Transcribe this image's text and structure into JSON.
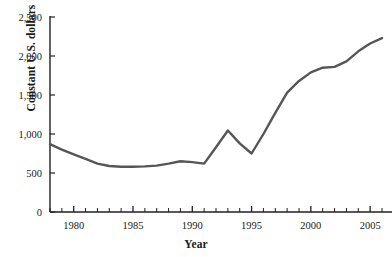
{
  "chart_data": {
    "type": "line",
    "title": "",
    "xlabel": "Year",
    "ylabel": "Constant U.S. dollars",
    "xlim": [
      1978,
      2006
    ],
    "ylim": [
      0,
      2500
    ],
    "grid": false,
    "legend": null,
    "line_color": "#565656",
    "axis_color": "#231f20",
    "x_major_ticks": [
      1980,
      1985,
      1990,
      1995,
      2000,
      2005
    ],
    "x_major_tick_labels": [
      "1980",
      "1985",
      "1990",
      "1995",
      "2000",
      "2005"
    ],
    "x_minor_tick_step": 1,
    "y_ticks": [
      0,
      500,
      1000,
      1500,
      2000,
      2500
    ],
    "y_tick_labels": [
      "0",
      "500",
      "1,000",
      "1,500",
      "2,000",
      "2,500"
    ],
    "x": [
      1978,
      1979,
      1980,
      1981,
      1982,
      1983,
      1984,
      1985,
      1986,
      1987,
      1988,
      1989,
      1990,
      1991,
      1992,
      1993,
      1994,
      1995,
      1996,
      1997,
      1998,
      1999,
      2000,
      2001,
      2002,
      2003,
      2004,
      2005,
      2006
    ],
    "values": [
      870,
      800,
      740,
      680,
      620,
      590,
      580,
      580,
      585,
      595,
      620,
      650,
      640,
      620,
      830,
      1045,
      880,
      750,
      1000,
      1270,
      1530,
      1680,
      1790,
      1850,
      1860,
      1930,
      2060,
      2160,
      2230
    ],
    "series": [
      {
        "name": "Constant U.S. dollars",
        "values": [
          870,
          800,
          740,
          680,
          620,
          590,
          580,
          580,
          585,
          595,
          620,
          650,
          640,
          620,
          830,
          1045,
          880,
          750,
          1000,
          1270,
          1530,
          1680,
          1790,
          1850,
          1860,
          1930,
          2060,
          2160,
          2230
        ]
      }
    ]
  },
  "top_sliver": {
    "text": " "
  }
}
